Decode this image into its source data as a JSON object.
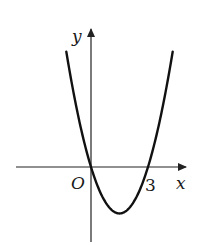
{
  "chart_data": {
    "type": "line",
    "title": "",
    "xlabel": "x",
    "ylabel": "y",
    "origin_label": "O",
    "tick_labels": [
      {
        "axis": "x",
        "value": 3,
        "label": "3"
      }
    ],
    "series": [
      {
        "name": "parabola",
        "description": "Upward-opening parabola crossing x-axis at 0 and 3, vertex near x=1.5 below the axis",
        "roots": [
          0,
          3
        ],
        "vertex": [
          1.5,
          -2.25
        ],
        "x": [
          -1.3,
          -1,
          -0.5,
          0,
          0.5,
          1,
          1.5,
          2,
          2.5,
          3,
          3.5,
          4,
          4.3
        ],
        "y": [
          5.59,
          4,
          1.75,
          0,
          -1.25,
          -2,
          -2.25,
          -2,
          -1.25,
          0,
          1.75,
          4,
          5.59
        ]
      }
    ],
    "grid": false,
    "legend": "none",
    "colors": {
      "curve": "#111111",
      "axes": "#222222",
      "background": "#ffffff"
    }
  },
  "labels": {
    "y_axis": "y",
    "x_axis": "x",
    "origin": "O",
    "tick_3": "3"
  }
}
